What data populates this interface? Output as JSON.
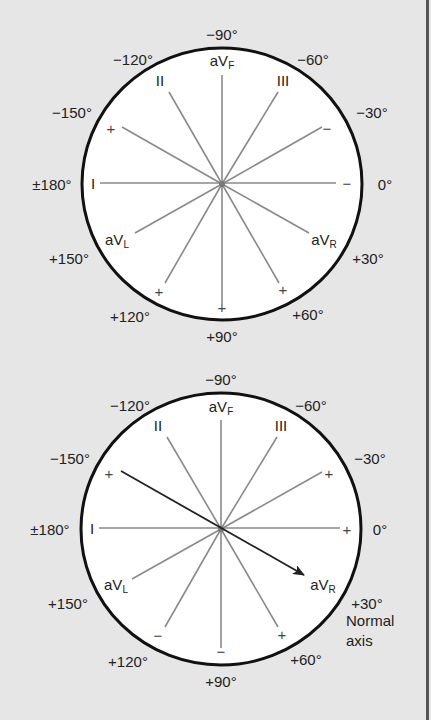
{
  "colors": {
    "background": "#e6e6e6",
    "circle_fill": "#ffffff",
    "circle_stroke": "#111111",
    "axis_line": "#8a8a8a",
    "arrow": "#222222",
    "text": "#222222"
  },
  "diagrams": [
    {
      "id": "hexaxial-reference",
      "center": [
        222,
        184
      ],
      "rx": 140,
      "ry": 136,
      "degree_labels": [
        {
          "text": "−90°",
          "x": 222,
          "y": 40,
          "anchor": "middle"
        },
        {
          "text": "−120°",
          "x": 133,
          "y": 65,
          "anchor": "middle"
        },
        {
          "text": "−60°",
          "x": 313,
          "y": 65,
          "anchor": "middle"
        },
        {
          "text": "−150°",
          "x": 72,
          "y": 118,
          "anchor": "middle"
        },
        {
          "text": "−30°",
          "x": 372,
          "y": 118,
          "anchor": "middle"
        },
        {
          "text": "±180°",
          "x": 52,
          "y": 190,
          "anchor": "middle"
        },
        {
          "text": "0°",
          "x": 385,
          "y": 190,
          "anchor": "middle"
        },
        {
          "text": "+150°",
          "x": 69,
          "y": 264,
          "anchor": "middle"
        },
        {
          "text": "+30°",
          "x": 368,
          "y": 264,
          "anchor": "middle"
        },
        {
          "text": "+120°",
          "x": 130,
          "y": 322,
          "anchor": "middle"
        },
        {
          "text": "+60°",
          "x": 308,
          "y": 320,
          "anchor": "middle"
        },
        {
          "text": "+90°",
          "x": 222,
          "y": 342,
          "anchor": "middle"
        }
      ],
      "lead_labels": [
        {
          "main": "aV",
          "sub": "F",
          "x": 222,
          "y": 66
        },
        {
          "main": "II",
          "sub": "",
          "x": 160,
          "y": 86
        },
        {
          "main": "III",
          "sub": "",
          "x": 283,
          "y": 86
        },
        {
          "main": "I",
          "sub": "",
          "x": 93,
          "y": 189
        },
        {
          "main": "aV",
          "sub": "L",
          "x": 117,
          "y": 245
        },
        {
          "main": "aV",
          "sub": "R",
          "x": 324,
          "y": 245
        }
      ],
      "signs": [
        {
          "text": "+",
          "x": 111,
          "y": 134
        },
        {
          "text": "−",
          "x": 327,
          "y": 134
        },
        {
          "text": "−",
          "x": 347,
          "y": 189
        },
        {
          "text": "+",
          "x": 159,
          "y": 297
        },
        {
          "text": "+",
          "x": 222,
          "y": 313
        },
        {
          "text": "+",
          "x": 283,
          "y": 295
        }
      ],
      "axis_lines": [
        {
          "from": [
            100,
            183
          ],
          "to": [
            336,
            183
          ]
        },
        {
          "from": [
            222,
            75
          ],
          "to": [
            222,
            305
          ]
        },
        {
          "from": [
            169,
            92
          ],
          "to": [
            222,
            184
          ]
        },
        {
          "from": [
            278,
            92
          ],
          "to": [
            222,
            184
          ]
        },
        {
          "from": [
            122,
            127
          ],
          "to": [
            222,
            184
          ]
        },
        {
          "from": [
            322,
            127
          ],
          "to": [
            222,
            184
          ]
        },
        {
          "from": [
            222,
            184
          ],
          "to": [
            135,
            233
          ]
        },
        {
          "from": [
            222,
            184
          ],
          "to": [
            309,
            233
          ]
        },
        {
          "from": [
            222,
            184
          ],
          "to": [
            165,
            283
          ]
        },
        {
          "from": [
            222,
            184
          ],
          "to": [
            279,
            283
          ]
        }
      ],
      "arrow": null,
      "caption": ""
    },
    {
      "id": "normal-axis",
      "center": [
        221,
        529
      ],
      "rx": 140,
      "ry": 136,
      "degree_labels": [
        {
          "text": "−90°",
          "x": 221,
          "y": 385,
          "anchor": "middle"
        },
        {
          "text": "−120°",
          "x": 130,
          "y": 411,
          "anchor": "middle"
        },
        {
          "text": "−60°",
          "x": 311,
          "y": 411,
          "anchor": "middle"
        },
        {
          "text": "−150°",
          "x": 70,
          "y": 464,
          "anchor": "middle"
        },
        {
          "text": "−30°",
          "x": 370,
          "y": 464,
          "anchor": "middle"
        },
        {
          "text": "±180°",
          "x": 50,
          "y": 535,
          "anchor": "middle"
        },
        {
          "text": "0°",
          "x": 380,
          "y": 535,
          "anchor": "middle"
        },
        {
          "text": "+150°",
          "x": 68,
          "y": 609,
          "anchor": "middle"
        },
        {
          "text": "+30°",
          "x": 367,
          "y": 609,
          "anchor": "middle"
        },
        {
          "text": "+120°",
          "x": 128,
          "y": 667,
          "anchor": "middle"
        },
        {
          "text": "+60°",
          "x": 306,
          "y": 665,
          "anchor": "middle"
        },
        {
          "text": "+90°",
          "x": 221,
          "y": 687,
          "anchor": "middle"
        }
      ],
      "lead_labels": [
        {
          "main": "aV",
          "sub": "F",
          "x": 221,
          "y": 412
        },
        {
          "main": "II",
          "sub": "",
          "x": 158,
          "y": 431
        },
        {
          "main": "III",
          "sub": "",
          "x": 281,
          "y": 431
        },
        {
          "main": "I",
          "sub": "",
          "x": 92,
          "y": 534
        },
        {
          "main": "aV",
          "sub": "L",
          "x": 116,
          "y": 590
        },
        {
          "main": "aV",
          "sub": "R",
          "x": 323,
          "y": 590
        }
      ],
      "signs": [
        {
          "text": "+",
          "x": 109,
          "y": 479
        },
        {
          "text": "+",
          "x": 329,
          "y": 479
        },
        {
          "text": "+",
          "x": 347,
          "y": 535
        },
        {
          "text": "−",
          "x": 158,
          "y": 641
        },
        {
          "text": "−",
          "x": 221,
          "y": 657
        },
        {
          "text": "+",
          "x": 282,
          "y": 640
        }
      ],
      "axis_lines": [
        {
          "from": [
            99,
            528
          ],
          "to": [
            340,
            528
          ]
        },
        {
          "from": [
            221,
            420
          ],
          "to": [
            221,
            648
          ]
        },
        {
          "from": [
            167,
            437
          ],
          "to": [
            221,
            529
          ]
        },
        {
          "from": [
            277,
            437
          ],
          "to": [
            221,
            529
          ]
        },
        {
          "from": [
            221,
            529
          ],
          "to": [
            322,
            472
          ]
        },
        {
          "from": [
            221,
            529
          ],
          "to": [
            132,
            579
          ]
        },
        {
          "from": [
            221,
            529
          ],
          "to": [
            165,
            627
          ]
        },
        {
          "from": [
            221,
            529
          ],
          "to": [
            278,
            627
          ]
        }
      ],
      "arrow": {
        "from": [
          121,
          471
        ],
        "to": [
          304,
          575
        ]
      },
      "caption": [
        "Normal",
        "axis"
      ],
      "caption_pos": [
        346,
        626
      ]
    }
  ]
}
